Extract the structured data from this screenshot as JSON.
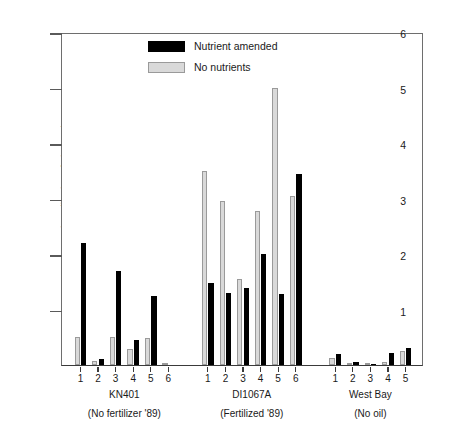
{
  "chart_data": {
    "type": "bar",
    "title": "",
    "xlabel": "",
    "ylabel": "Percentage mineralization of phenanthrene",
    "ylim": [
      0,
      6
    ],
    "yticks": [
      0,
      1,
      2,
      3,
      4,
      5,
      6
    ],
    "ytick_labels": [
      "",
      "1",
      "2",
      "3",
      "4",
      "5",
      "6"
    ],
    "grid": false,
    "legend_position": "upper left",
    "legend": [
      "Nutrient amended",
      "No nutrients"
    ],
    "series": [
      {
        "name": "Nutrient amended",
        "color": "#000000",
        "values": [
          2.2,
          0.1,
          1.7,
          0.45,
          1.25,
          0.0,
          1.48,
          1.3,
          1.38,
          2.0,
          1.28,
          3.45,
          0.2,
          0.05,
          0.02,
          0.22,
          0.3
        ]
      },
      {
        "name": "No nutrients",
        "color": "#d9d9d9",
        "values": [
          0.5,
          0.07,
          0.5,
          0.28,
          0.48,
          0.02,
          3.5,
          2.95,
          1.55,
          2.78,
          5.0,
          3.05,
          0.12,
          0.02,
          0.03,
          0.06,
          0.25
        ]
      }
    ],
    "categories": [
      "1",
      "2",
      "3",
      "4",
      "5",
      "6",
      "1",
      "2",
      "3",
      "4",
      "5",
      "6",
      "1",
      "2",
      "3",
      "4",
      "5"
    ],
    "groups": [
      {
        "name": "KN401",
        "subtitle": "(No fertilizer '89)",
        "site_labels": [
          "1",
          "2",
          "3",
          "4",
          "5",
          "6"
        ]
      },
      {
        "name": "DI1067A",
        "subtitle": "(Fertilized '89)",
        "site_labels": [
          "1",
          "2",
          "3",
          "4",
          "5",
          "6"
        ]
      },
      {
        "name": "West Bay",
        "subtitle": "(No oil)",
        "site_labels": [
          "1",
          "2",
          "3",
          "4",
          "5"
        ]
      }
    ]
  },
  "axis": {
    "y_title": "Percentage mineralization of phenanthrene"
  },
  "legend": {
    "items": [
      {
        "label": "Nutrient amended",
        "swatch": "black-swatch-icon"
      },
      {
        "label": "No nutrients",
        "swatch": "grey-swatch-icon"
      }
    ]
  }
}
